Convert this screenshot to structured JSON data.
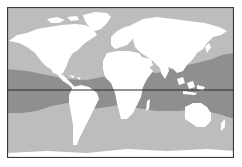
{
  "map": {
    "type": "world-map",
    "projection": "equirectangular (Pacific-cropped)",
    "colors": {
      "ocean": "#bdbdbd",
      "tropical_band": "#8f8f8f",
      "land": "#ffffff",
      "frame": "#3a3a3a",
      "equator": "#2a2a2a",
      "background": "#ffffff"
    },
    "layers": [
      {
        "name": "ocean",
        "description": "light grey ocean"
      },
      {
        "name": "tropical-band",
        "description": "darker grey band of tropical waters straddling the equator"
      },
      {
        "name": "continents",
        "description": "white landmasses"
      },
      {
        "name": "equator-line",
        "description": "horizontal black line"
      }
    ]
  }
}
